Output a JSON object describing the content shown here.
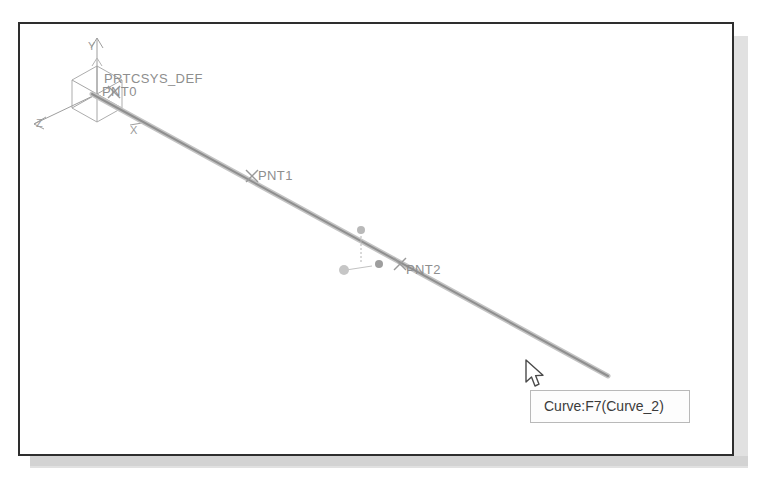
{
  "window": {
    "title": "CAD graphics viewport",
    "background_color": "#ffffff",
    "border_color": "#2e2e2e"
  },
  "model": {
    "csys_label": "PRTCSYS_DEF",
    "points": [
      {
        "name": "PNT0",
        "label": "PNT0",
        "x": 95,
        "y": 70
      },
      {
        "name": "PNT1",
        "label": "PNT1",
        "x": 232,
        "y": 152
      },
      {
        "name": "PNT2",
        "label": "PNT2",
        "x": 380,
        "y": 245
      }
    ],
    "axes": [
      {
        "name": "Y",
        "label": "Y"
      },
      {
        "name": "Z",
        "label": "Z"
      },
      {
        "name": "X",
        "label": "X"
      }
    ],
    "curve": {
      "name": "Curve_2",
      "geometry_color": "#9a9a9a",
      "highlight_color": "#b0b0b0"
    }
  },
  "tooltip": {
    "text": "Curve:F7(Curve_2)",
    "entity_type": "Curve",
    "feature_id": "F7",
    "feature_name": "Curve_2",
    "background_color": "#fdfdfd",
    "border_color": "#b9b9b9",
    "text_color": "#3b3b3b"
  },
  "cursor": {
    "kind": "arrow-pointer",
    "x": 505,
    "y": 335
  },
  "colors": {
    "canvas": "#ffffff",
    "label_grey": "#8e8e8e",
    "shadow_grey": "#c9c9c9"
  }
}
